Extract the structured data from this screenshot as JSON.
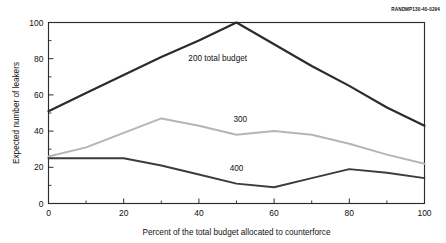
{
  "credit": {
    "text": "RANDMP130-40-0294"
  },
  "chart_data": {
    "type": "line",
    "title": "",
    "xlabel": "Percent of the total budget allocated to counterforce",
    "ylabel": "Expected number of leakers",
    "xlim": [
      0,
      100
    ],
    "ylim": [
      0,
      100
    ],
    "xticks": [
      0,
      20,
      40,
      60,
      80,
      100
    ],
    "yticks": [
      0,
      20,
      40,
      60,
      80,
      100
    ],
    "xticks_minor": [
      10,
      30,
      50,
      70,
      90
    ],
    "yticks_minor": [
      10,
      30,
      50,
      70,
      90
    ],
    "grid": false,
    "legend_position": "inline-annotations",
    "series": [
      {
        "name": "200 total budget",
        "label": "200 total budget",
        "color": "#2b2b2b",
        "width": 2.2,
        "label_x": 45,
        "label_y": 79,
        "x": [
          0,
          10,
          20,
          30,
          40,
          50,
          60,
          70,
          80,
          90,
          100
        ],
        "values": [
          51,
          61,
          71,
          81,
          90,
          100,
          88,
          76,
          65,
          53,
          43
        ]
      },
      {
        "name": "300",
        "label": "300",
        "color": "#b5b5b5",
        "width": 2.0,
        "label_x": 51,
        "label_y": 45,
        "x": [
          0,
          10,
          20,
          30,
          40,
          50,
          60,
          70,
          80,
          90,
          100
        ],
        "values": [
          26,
          31,
          39,
          47,
          43,
          38,
          40,
          38,
          33,
          27,
          22
        ]
      },
      {
        "name": "400",
        "label": "400",
        "color": "#3c3c3c",
        "width": 1.9,
        "label_x": 50,
        "label_y": 18,
        "x": [
          0,
          10,
          20,
          30,
          40,
          50,
          60,
          70,
          80,
          90,
          100
        ],
        "values": [
          25,
          25,
          25,
          21,
          16,
          11,
          9,
          14,
          19,
          17,
          14
        ]
      }
    ]
  }
}
